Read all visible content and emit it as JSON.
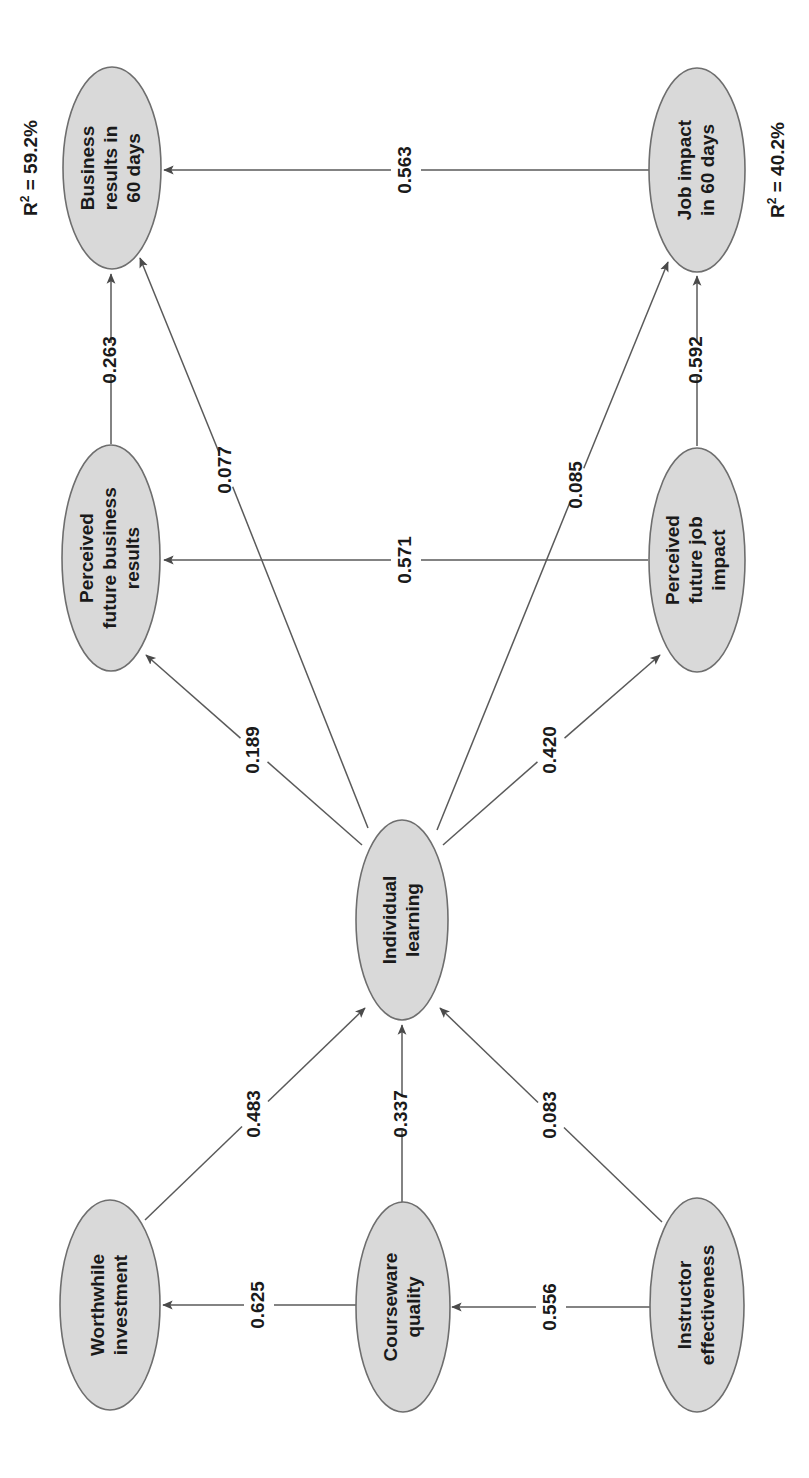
{
  "diagram": {
    "type": "sem-path-diagram",
    "orientation": "rotated-90-ccw",
    "colors": {
      "node_fill": "#d9d9d9",
      "node_stroke": "#6e6e6e",
      "edge_stroke": "#5a5a5a",
      "text": "#1a1a1a",
      "background": "#ffffff"
    },
    "nodes": [
      {
        "id": "business_results_60",
        "lines": [
          "Business",
          "results in",
          "60 days"
        ],
        "cx": 112,
        "cy": 168,
        "rx": 49,
        "ry": 101,
        "r2": "R² = 59.2%",
        "r2_value": "59.2%",
        "r2_x": 32,
        "r2_y": 168
      },
      {
        "id": "job_impact_60",
        "lines": [
          "Job impact",
          "in 60 days"
        ],
        "cx": 697,
        "cy": 170,
        "rx": 48,
        "ry": 102,
        "r2": "R² = 40.2%",
        "r2_value": "40.2%",
        "r2_x": 779,
        "r2_y": 170
      },
      {
        "id": "perceived_future_business_results",
        "lines": [
          "Perceived",
          "future business",
          "results"
        ],
        "cx": 111,
        "cy": 558,
        "rx": 49,
        "ry": 113,
        "r2": null,
        "r2_value": null,
        "r2_x": null,
        "r2_y": null
      },
      {
        "id": "perceived_future_job_impact",
        "lines": [
          "Perceived",
          "future job",
          "impact"
        ],
        "cx": 697,
        "cy": 560,
        "rx": 48,
        "ry": 112,
        "r2": null,
        "r2_value": null,
        "r2_x": null,
        "r2_y": null
      },
      {
        "id": "individual_learning",
        "lines": [
          "Individual",
          "learning"
        ],
        "cx": 402,
        "cy": 920,
        "rx": 46,
        "ry": 100,
        "r2": null,
        "r2_value": null,
        "r2_x": null,
        "r2_y": null
      },
      {
        "id": "worthwhile_investment",
        "lines": [
          "Worthwhile",
          "investment"
        ],
        "cx": 110,
        "cy": 1305,
        "rx": 50,
        "ry": 105,
        "r2": null,
        "r2_value": null,
        "r2_x": null,
        "r2_y": null
      },
      {
        "id": "courseware_quality",
        "lines": [
          "Courseware",
          "quality"
        ],
        "cx": 403,
        "cy": 1307,
        "rx": 47,
        "ry": 105,
        "r2": null,
        "r2_value": null,
        "r2_x": null,
        "r2_y": null
      },
      {
        "id": "instructor_effectiveness",
        "lines": [
          "Instructor",
          "effectiveness"
        ],
        "cx": 697,
        "cy": 1305,
        "rx": 47,
        "ry": 107,
        "r2": null,
        "r2_value": null,
        "r2_x": null,
        "r2_y": null
      }
    ],
    "edges": [
      {
        "id": "e_job_to_business",
        "from": "job_impact_60",
        "to": "business_results_60",
        "coefficient": "0.563",
        "x1": 649,
        "y1": 170,
        "x2": 164,
        "y2": 170,
        "lx": 406,
        "ly": 170,
        "gap": 30
      },
      {
        "id": "e_pfbr_to_business",
        "from": "perceived_future_business_results",
        "to": "business_results_60",
        "coefficient": "0.263",
        "x1": 111,
        "y1": 444,
        "x2": 111,
        "y2": 274,
        "lx": 111,
        "ly": 360,
        "gap": 34
      },
      {
        "id": "e_il_to_business",
        "from": "individual_learning",
        "to": "business_results_60",
        "coefficient": "0.077",
        "x1": 368,
        "y1": 828,
        "x2": 140,
        "y2": 258,
        "lx": 226,
        "ly": 470,
        "gap": 36
      },
      {
        "id": "e_pfji_to_job",
        "from": "perceived_future_job_impact",
        "to": "job_impact_60",
        "coefficient": "0.592",
        "x1": 697,
        "y1": 446,
        "x2": 697,
        "y2": 276,
        "lx": 697,
        "ly": 360,
        "gap": 34
      },
      {
        "id": "e_il_to_job",
        "from": "individual_learning",
        "to": "job_impact_60",
        "coefficient": "0.085",
        "x1": 437,
        "y1": 830,
        "x2": 668,
        "y2": 262,
        "lx": 577,
        "ly": 485,
        "gap": 36
      },
      {
        "id": "e_pfji_to_pfbr",
        "from": "perceived_future_job_impact",
        "to": "perceived_future_business_results",
        "coefficient": "0.571",
        "x1": 648,
        "y1": 560,
        "x2": 164,
        "y2": 560,
        "lx": 406,
        "ly": 560,
        "gap": 30
      },
      {
        "id": "e_il_to_pfbr",
        "from": "individual_learning",
        "to": "perceived_future_business_results",
        "coefficient": "0.189",
        "x1": 362,
        "y1": 845,
        "x2": 146,
        "y2": 655,
        "lx": 254,
        "ly": 750,
        "gap": 36
      },
      {
        "id": "e_il_to_pfji",
        "from": "individual_learning",
        "to": "perceived_future_job_impact",
        "coefficient": "0.420",
        "x1": 443,
        "y1": 845,
        "x2": 660,
        "y2": 655,
        "lx": 551,
        "ly": 750,
        "gap": 36
      },
      {
        "id": "e_wi_to_il",
        "from": "worthwhile_investment",
        "to": "individual_learning",
        "coefficient": "0.483",
        "x1": 145,
        "y1": 1220,
        "x2": 365,
        "y2": 1008,
        "lx": 255,
        "ly": 1114,
        "gap": 36
      },
      {
        "id": "e_cq_to_il",
        "from": "courseware_quality",
        "to": "individual_learning",
        "coefficient": "0.337",
        "x1": 402,
        "y1": 1202,
        "x2": 402,
        "y2": 1025,
        "lx": 402,
        "ly": 1114,
        "gap": 34
      },
      {
        "id": "e_ie_to_il",
        "from": "instructor_effectiveness",
        "to": "individual_learning",
        "coefficient": "0.083",
        "x1": 662,
        "y1": 1222,
        "x2": 440,
        "y2": 1008,
        "lx": 551,
        "ly": 1115,
        "gap": 36
      },
      {
        "id": "e_cq_to_wi",
        "from": "courseware_quality",
        "to": "worthwhile_investment",
        "coefficient": "0.625",
        "x1": 356,
        "y1": 1305,
        "x2": 163,
        "y2": 1305,
        "lx": 259,
        "ly": 1305,
        "gap": 30
      },
      {
        "id": "e_ie_to_cq",
        "from": "instructor_effectiveness",
        "to": "courseware_quality",
        "coefficient": "0.556",
        "x1": 650,
        "y1": 1307,
        "x2": 452,
        "y2": 1307,
        "lx": 551,
        "ly": 1307,
        "gap": 30
      }
    ]
  },
  "chart_data": {
    "type": "diagram",
    "title": "",
    "nodes": [
      "Business results in 60 days",
      "Job impact in 60 days",
      "Perceived future business results",
      "Perceived future job impact",
      "Individual learning",
      "Worthwhile investment",
      "Courseware quality",
      "Instructor effectiveness"
    ],
    "paths": [
      {
        "source": "Job impact in 60 days",
        "target": "Business results in 60 days",
        "value": 0.563
      },
      {
        "source": "Perceived future business results",
        "target": "Business results in 60 days",
        "value": 0.263
      },
      {
        "source": "Individual learning",
        "target": "Business results in 60 days",
        "value": 0.077
      },
      {
        "source": "Perceived future job impact",
        "target": "Job impact in 60 days",
        "value": 0.592
      },
      {
        "source": "Individual learning",
        "target": "Job impact in 60 days",
        "value": 0.085
      },
      {
        "source": "Perceived future job impact",
        "target": "Perceived future business results",
        "value": 0.571
      },
      {
        "source": "Individual learning",
        "target": "Perceived future business results",
        "value": 0.189
      },
      {
        "source": "Individual learning",
        "target": "Perceived future job impact",
        "value": 0.42
      },
      {
        "source": "Worthwhile investment",
        "target": "Individual learning",
        "value": 0.483
      },
      {
        "source": "Courseware quality",
        "target": "Individual learning",
        "value": 0.337
      },
      {
        "source": "Instructor effectiveness",
        "target": "Individual learning",
        "value": 0.083
      },
      {
        "source": "Courseware quality",
        "target": "Worthwhile investment",
        "value": 0.625
      },
      {
        "source": "Instructor effectiveness",
        "target": "Courseware quality",
        "value": 0.556
      }
    ],
    "r_squared": [
      {
        "node": "Business results in 60 days",
        "label": "R² = 59.2%",
        "value": 59.2
      },
      {
        "node": "Job impact in 60 days",
        "label": "R² = 40.2%",
        "value": 40.2
      }
    ]
  }
}
